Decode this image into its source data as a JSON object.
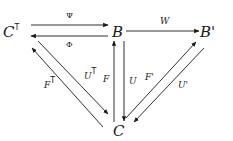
{
  "diagram": {
    "type": "commutative-diagram",
    "nodes": [
      {
        "id": "CT",
        "label": "C",
        "superscript": "T"
      },
      {
        "id": "B",
        "label": "B"
      },
      {
        "id": "Bp",
        "label": "B'"
      },
      {
        "id": "C",
        "label": "C"
      }
    ],
    "edges": [
      {
        "id": "psi",
        "from": "CT",
        "to": "B",
        "label": "Ψ"
      },
      {
        "id": "phi",
        "from": "B",
        "to": "CT",
        "label": "Φ"
      },
      {
        "id": "w",
        "from": "B",
        "to": "Bp",
        "label": "W"
      },
      {
        "id": "ft",
        "from": "C",
        "to": "CT",
        "label": "F",
        "superscript": "T"
      },
      {
        "id": "ut",
        "from": "CT",
        "to": "C",
        "label": "U",
        "superscript": "T"
      },
      {
        "id": "f",
        "from": "C",
        "to": "B",
        "label": "F"
      },
      {
        "id": "u",
        "from": "B",
        "to": "C",
        "label": "U"
      },
      {
        "id": "fp",
        "from": "C",
        "to": "Bp",
        "label": "F'"
      },
      {
        "id": "up",
        "from": "Bp",
        "to": "C",
        "label": "U'"
      }
    ]
  },
  "labels": {
    "node_ct": "C",
    "node_ct_sup": "T",
    "node_b": "B",
    "node_bp": "B'",
    "node_c": "C",
    "edge_psi": "Ψ",
    "edge_phi": "Φ",
    "edge_w": "W",
    "edge_ft": "F",
    "edge_ft_sup": "T",
    "edge_ut": "U",
    "edge_ut_sup": "T",
    "edge_f": "F",
    "edge_u": "U",
    "edge_fp": "F'",
    "edge_up": "U'"
  }
}
